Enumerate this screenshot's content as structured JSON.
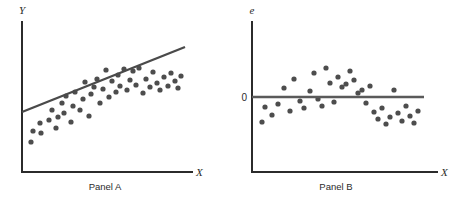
{
  "figure": {
    "background": "#ffffff",
    "ink_color": "#2b2b2b",
    "marker_color": "#4d4d4d",
    "line_color": "#4a4a4a"
  },
  "panels": [
    {
      "id": "panel-a",
      "caption": "Panel A",
      "y_axis_label": "Y",
      "x_axis_label": "X",
      "has_zero_label": false,
      "zero_label": "",
      "geometry": {
        "axis_x": 22,
        "axis_top": 22,
        "axis_bottom": 172,
        "axis_right": 192,
        "trend_x1": 22,
        "trend_y1": 112,
        "trend_x2": 185,
        "trend_y2": 47
      },
      "caption_x": 105,
      "caption_y": 190
    },
    {
      "id": "panel-b",
      "caption": "Panel B",
      "y_axis_label": "e",
      "x_axis_label": "X",
      "has_zero_label": true,
      "zero_label": "0",
      "geometry": {
        "axis_x": 252,
        "axis_top": 22,
        "axis_bottom": 172,
        "axis_right": 437,
        "zero_y": 97,
        "zero_x1": 252,
        "zero_x2": 424
      },
      "caption_x": 336,
      "caption_y": 190
    }
  ],
  "chart_data": [
    {
      "type": "scatter",
      "title": "Panel A",
      "xlabel": "X",
      "ylabel": "Y",
      "grid": false,
      "legend": "none",
      "marker_radius_px": 2.6,
      "overlay": {
        "type": "line",
        "name": "fitted regression line",
        "endpoints_px": [
          [
            22,
            112
          ],
          [
            185,
            47
          ]
        ]
      },
      "note": "Positive linear relationship between X and Y with fitted least-squares line through the point cloud",
      "points_px": [
        [
          31,
          142
        ],
        [
          33,
          131
        ],
        [
          41,
          133
        ],
        [
          40,
          123
        ],
        [
          49,
          120
        ],
        [
          52,
          110
        ],
        [
          56,
          128
        ],
        [
          58,
          117
        ],
        [
          62,
          103
        ],
        [
          64,
          113
        ],
        [
          66,
          96
        ],
        [
          71,
          122
        ],
        [
          73,
          106
        ],
        [
          75,
          92
        ],
        [
          80,
          110
        ],
        [
          83,
          99
        ],
        [
          85,
          82
        ],
        [
          89,
          116
        ],
        [
          91,
          94
        ],
        [
          94,
          87
        ],
        [
          97,
          79
        ],
        [
          100,
          103
        ],
        [
          103,
          89
        ],
        [
          106,
          70
        ],
        [
          109,
          97
        ],
        [
          112,
          81
        ],
        [
          116,
          92
        ],
        [
          118,
          75
        ],
        [
          120,
          86
        ],
        [
          124,
          69
        ],
        [
          127,
          90
        ],
        [
          130,
          80
        ],
        [
          133,
          71
        ],
        [
          136,
          85
        ],
        [
          139,
          68
        ],
        [
          143,
          93
        ],
        [
          146,
          79
        ],
        [
          150,
          87
        ],
        [
          153,
          72
        ],
        [
          157,
          83
        ],
        [
          160,
          90
        ],
        [
          164,
          77
        ],
        [
          168,
          86
        ],
        [
          171,
          73
        ],
        [
          175,
          81
        ],
        [
          178,
          88
        ],
        [
          181,
          76
        ]
      ]
    },
    {
      "type": "scatter",
      "title": "Panel B",
      "xlabel": "X",
      "ylabel": "e",
      "grid": false,
      "legend": "none",
      "marker_radius_px": 2.6,
      "y_reference": {
        "value": 0,
        "label": "0",
        "y_px": 97
      },
      "overlay": {
        "type": "line",
        "name": "zero residual line",
        "endpoints_px": [
          [
            252,
            97
          ],
          [
            424,
            97
          ]
        ]
      },
      "note": "Residual plot showing a systematic inverted-U (curvilinear) pattern: residuals negative at low and high X, positive in the middle",
      "points_px": [
        [
          262,
          122
        ],
        [
          265,
          107
        ],
        [
          272,
          115
        ],
        [
          278,
          104
        ],
        [
          284,
          88
        ],
        [
          290,
          111
        ],
        [
          294,
          79
        ],
        [
          300,
          101
        ],
        [
          304,
          108
        ],
        [
          310,
          91
        ],
        [
          314,
          73
        ],
        [
          318,
          99
        ],
        [
          322,
          106
        ],
        [
          326,
          68
        ],
        [
          330,
          83
        ],
        [
          334,
          102
        ],
        [
          338,
          77
        ],
        [
          342,
          87
        ],
        [
          346,
          84
        ],
        [
          350,
          71
        ],
        [
          354,
          80
        ],
        [
          358,
          93
        ],
        [
          362,
          90
        ],
        [
          366,
          103
        ],
        [
          370,
          86
        ],
        [
          374,
          112
        ],
        [
          378,
          119
        ],
        [
          382,
          108
        ],
        [
          386,
          124
        ],
        [
          390,
          117
        ],
        [
          394,
          90
        ],
        [
          398,
          113
        ],
        [
          402,
          121
        ],
        [
          406,
          106
        ],
        [
          410,
          116
        ],
        [
          414,
          123
        ],
        [
          418,
          111
        ]
      ]
    }
  ]
}
